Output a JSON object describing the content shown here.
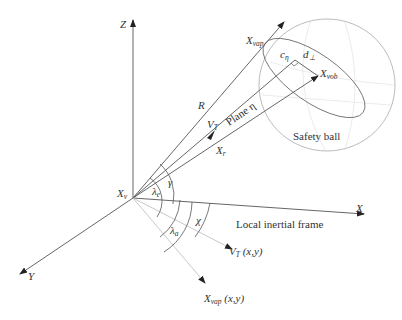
{
  "diagram": {
    "axes": {
      "z_label": "Z",
      "x_label": "X",
      "y_label": "Y"
    },
    "origin_label": {
      "main": "X",
      "sub": "v"
    },
    "rays": {
      "R_label": "R",
      "VT_label": {
        "main": "V",
        "sub": "T"
      },
      "Xr_label": {
        "main": "X",
        "sub": "r"
      },
      "plane_label": "Plane η"
    },
    "points": {
      "xvap": {
        "main": "X",
        "sub": "vap"
      },
      "xvob": {
        "main": "X",
        "sub": "vob"
      },
      "c_eta": {
        "main": "c",
        "sub": "η"
      },
      "d_perp": {
        "main": "d",
        "sub": "⊥"
      }
    },
    "angles": {
      "gamma": "γ",
      "lambda_e": {
        "main": "λ",
        "sub": "e"
      },
      "lambda_a": {
        "main": "λ",
        "sub": "a"
      },
      "chi": "χ"
    },
    "projections": {
      "vt_xy": {
        "main": "V",
        "sub": "T",
        "suffix": " (x,y)"
      },
      "xvap_xy": {
        "main": "X",
        "sub": "vap",
        "suffix": " (x,y)"
      }
    },
    "captions": {
      "safety_ball": "Safety ball",
      "local_frame": "Local inertial frame"
    },
    "colors": {
      "line": "#555555",
      "light_line": "#bbbbbb",
      "ball": "#aaaaaa",
      "text": "#333333"
    }
  }
}
